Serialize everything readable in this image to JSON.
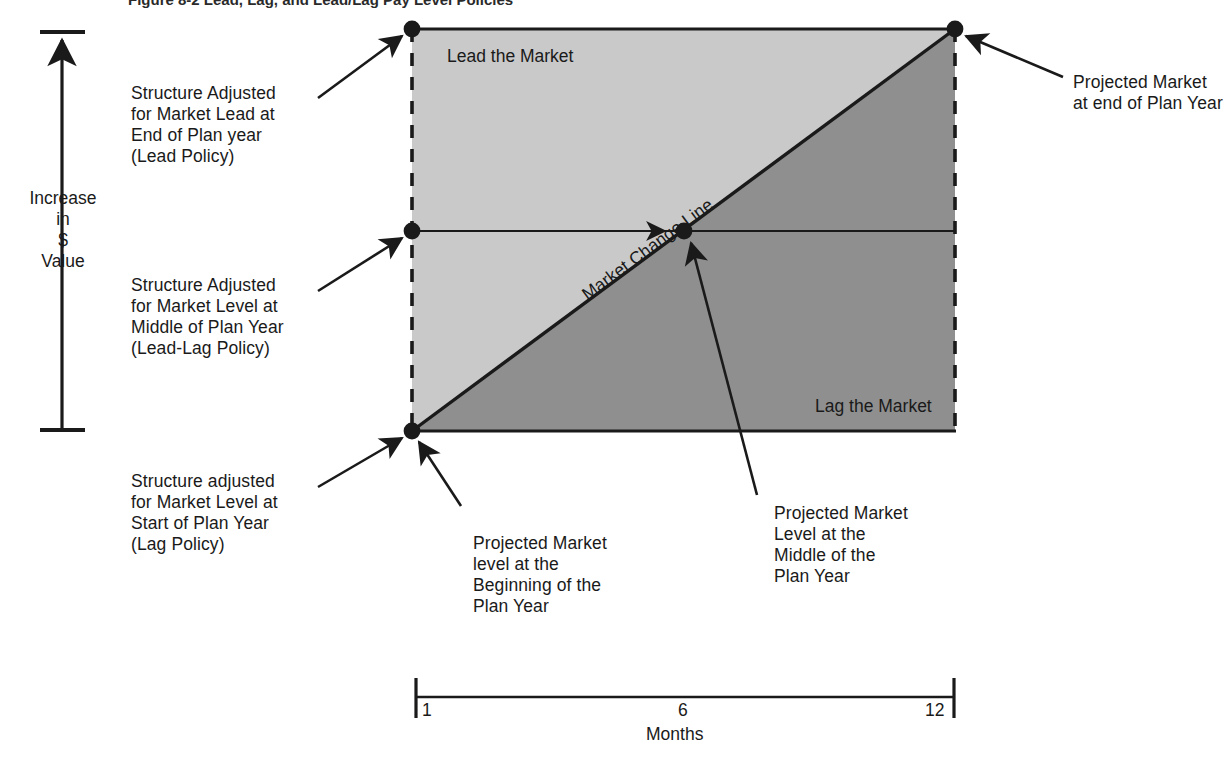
{
  "figure": {
    "title_partial": "Figure 8-2  Lead, Lag, and Lead/Lag Pay Level Policies",
    "y_axis_label": "Increase\nin\n$\nValue",
    "x_axis_label": "Months",
    "x_ticks": [
      "1",
      "6",
      "12"
    ],
    "region_upper": "Lead the Market",
    "region_lower": "Lag the Market",
    "diagonal_label": "Market Change Line"
  },
  "annotations": {
    "lead_policy": "Structure Adjusted\nfor Market Lead at\nEnd of Plan year\n(Lead Policy)",
    "lead_lag_policy": "Structure Adjusted\nfor Market Level at\nMiddle of Plan Year\n(Lead-Lag Policy)",
    "lag_policy": "Structure adjusted\nfor Market Level at\nStart of Plan Year\n(Lag Policy)",
    "market_start": "Projected Market\nlevel at the\nBeginning of the\nPlan Year",
    "market_middle": "Projected Market\nLevel at the\nMiddle of the\nPlan Year",
    "market_end": "Projected Market\nat end of Plan Year"
  },
  "chart_data": {
    "type": "area",
    "title": "Lead, Lag, and Lead/Lag Pay Level Policies",
    "xlabel": "Months",
    "ylabel": "Increase in $ Value",
    "x": [
      1,
      6,
      12
    ],
    "xlim": [
      1,
      12
    ],
    "ylim": [
      0,
      1
    ],
    "grid": false,
    "legend": "none",
    "series": [
      {
        "name": "Market Change Line",
        "description": "Projected market level rising linearly from start to end of plan year",
        "points": [
          {
            "month": 1,
            "value": 0.0,
            "label": "Projected Market level at the Beginning of the Plan Year"
          },
          {
            "month": 6,
            "value": 0.5,
            "label": "Projected Market Level at the Middle of the Plan Year"
          },
          {
            "month": 12,
            "value": 1.0,
            "label": "Projected Market at end of Plan Year"
          }
        ]
      },
      {
        "name": "Lead Policy structure",
        "description": "Flat structure set at end-of-year market level for the whole plan year",
        "points": [
          {
            "month": 1,
            "value": 1.0,
            "label": "Structure Adjusted for Market Lead at End of Plan year (Lead Policy)"
          },
          {
            "month": 12,
            "value": 1.0,
            "label": ""
          }
        ]
      },
      {
        "name": "Lead-Lag Policy structure",
        "description": "Flat structure set at mid-year market level for the whole plan year",
        "points": [
          {
            "month": 1,
            "value": 0.5,
            "label": "Structure Adjusted for Market Level at Middle of Plan Year (Lead-Lag Policy)"
          },
          {
            "month": 12,
            "value": 0.5,
            "label": ""
          }
        ]
      },
      {
        "name": "Lag Policy structure",
        "description": "Flat structure set at start-of-year market level for the whole plan year",
        "points": [
          {
            "month": 1,
            "value": 0.0,
            "label": "Structure adjusted for Market Level at Start of Plan Year (Lag Policy)"
          },
          {
            "month": 12,
            "value": 0.0,
            "label": ""
          }
        ]
      }
    ],
    "regions": [
      {
        "name": "Lead the Market",
        "where": "above the Market Change Line",
        "fill": "#c9c9c9"
      },
      {
        "name": "Lag the Market",
        "where": "below the Market Change Line",
        "fill": "#8f8f8f"
      }
    ]
  },
  "colors": {
    "lead_fill": "#c9c9c9",
    "lag_fill": "#8f8f8f",
    "stroke": "#1a1a1a",
    "background": "#ffffff"
  }
}
